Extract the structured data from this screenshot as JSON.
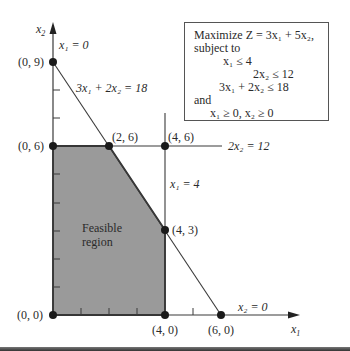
{
  "axes": {
    "x_label": "x",
    "x_label_sub": "1",
    "y_label": "x",
    "y_label_sub": "2"
  },
  "objective_box": {
    "lines": [
      "Maximize Z = 3x₁ + 5x₂,",
      "subject to",
      "x₁              ≤  4",
      "2x₂ ≤ 12",
      "3x₁ + 2x₂ ≤ 18",
      "and",
      "x₁ ≥ 0,   x₂ ≥ 0"
    ]
  },
  "constraint_labels": {
    "x1_eq_0": "x₁ = 0",
    "line_3x1_2x2": "3x₁ + 2x₂ = 18",
    "line_2x2": "2x₂ = 12",
    "x1_eq_4": "x₁ = 4",
    "x2_eq_0": "x₂ = 0"
  },
  "points": {
    "p09": "(0, 9)",
    "p06": "(0, 6)",
    "p26": "(2, 6)",
    "p46": "(4, 6)",
    "p43": "(4, 3)",
    "p00": "(0, 0)",
    "p40": "(4, 0)",
    "p60": "(6, 0)"
  },
  "region_label": [
    "Feasible",
    "region"
  ],
  "colors": {
    "feasible_fill": "#9a9a9a",
    "line": "#3a3a3a"
  }
}
